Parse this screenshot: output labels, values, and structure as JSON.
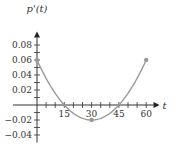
{
  "chart_data": {
    "type": "line",
    "title": "",
    "xlabel": "t",
    "ylabel": "p'(t)",
    "x_ticks": [
      15,
      30,
      45,
      60
    ],
    "y_ticks": [
      0.08,
      0.06,
      0.04,
      0.02,
      -0.02,
      -0.04
    ],
    "x_tick_labels": [
      "15",
      "30",
      "45",
      "60"
    ],
    "y_tick_labels": [
      "0.08",
      "0.06",
      "0.04",
      "0.02",
      "−0.02",
      "−0.04"
    ],
    "xlim": [
      0,
      65
    ],
    "ylim": [
      -0.05,
      0.09
    ],
    "grid": false,
    "legend": null,
    "series": [
      {
        "name": "p'(t)",
        "x": [
          0,
          15,
          30,
          45,
          60
        ],
        "y": [
          0.06,
          0,
          -0.02,
          0,
          0.06
        ],
        "endpoints_marked": true,
        "minimum_marked": {
          "x": 30,
          "y": -0.02
        }
      }
    ],
    "color": "#999999"
  }
}
